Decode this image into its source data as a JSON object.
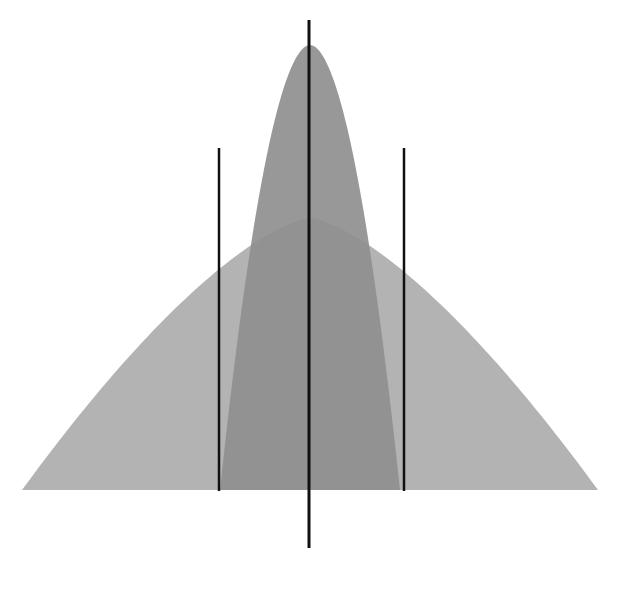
{
  "canvas": {
    "width": 636,
    "height": 589,
    "background": "#ffffff"
  },
  "colors": {
    "wide_fill": "#b3b3b3",
    "narrow_fill": "#8f8f8f",
    "overlap_fill": "#9a9a9a",
    "line": "#111111"
  },
  "diagram": {
    "baseline_y": 490,
    "wide_curve": {
      "left_x": 40,
      "right_x": 616,
      "peak_x": 310,
      "peak_y": 218
    },
    "narrow_curve": {
      "left_x": 222,
      "right_x": 402,
      "peak_x": 310,
      "peak_y": 45
    },
    "lines": [
      {
        "name": "center-line",
        "x": 309,
        "y1": 20,
        "y2": 548,
        "width": 3
      },
      {
        "name": "left-line",
        "x": 219,
        "y1": 148,
        "y2": 491,
        "width": 2.5
      },
      {
        "name": "right-line",
        "x": 404,
        "y1": 148,
        "y2": 491,
        "width": 2.5
      }
    ]
  }
}
